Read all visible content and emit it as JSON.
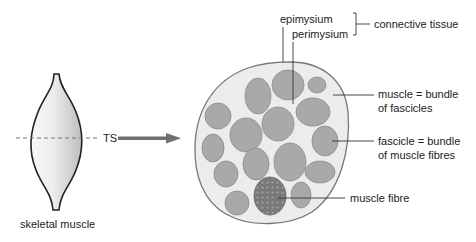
{
  "diagram": {
    "left_figure": {
      "caption": "skeletal muscle",
      "section_label": "TS"
    },
    "cross_section": {
      "labels": {
        "epimysium": "epimysium",
        "perimysium": "perimysium",
        "connective_tissue": "connective tissue",
        "muscle_line1": "muscle = bundle",
        "muscle_line2": "of fascicles",
        "fascicle_line1": "fascicle = bundle",
        "fascicle_line2": "of muscle fibres",
        "muscle_fibre": "muscle fibre"
      }
    },
    "colors": {
      "outline": "#777777",
      "cross_section_fill": "#ececec",
      "fascicle_fill": "#a9a9a9",
      "fibre_bundle_fill": "#7c7c7c",
      "arrow": "#707070",
      "text": "#222222"
    }
  }
}
